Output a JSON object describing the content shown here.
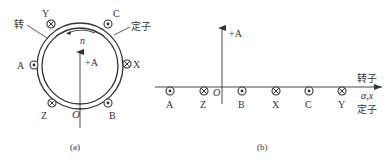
{
  "panel_a": {
    "caption": "(a)",
    "rotor_label": "转",
    "stator_label": "定子",
    "rotation_label": "n",
    "axis_label": "+A",
    "origin_label": "O",
    "conductors": [
      {
        "name": "Y",
        "symbol": "cross"
      },
      {
        "name": "C",
        "symbol": "dot"
      },
      {
        "name": "A",
        "symbol": "dot"
      },
      {
        "name": "X",
        "symbol": "cross"
      },
      {
        "name": "Z",
        "symbol": "cross"
      },
      {
        "name": "B",
        "symbol": "dot"
      }
    ]
  },
  "panel_b": {
    "caption": "(b)",
    "axis_label": "+A",
    "origin_label": "O",
    "rotor_label": "转子",
    "coord_label": "α,x",
    "stator_label": "定子",
    "conductors": [
      {
        "name": "A",
        "symbol": "dot"
      },
      {
        "name": "Z",
        "symbol": "cross"
      },
      {
        "name": "B",
        "symbol": "dot"
      },
      {
        "name": "X",
        "symbol": "cross"
      },
      {
        "name": "C",
        "symbol": "dot"
      },
      {
        "name": "Y",
        "symbol": "cross"
      }
    ]
  },
  "colors": {
    "line": "#333333",
    "background": "#ffffff"
  }
}
